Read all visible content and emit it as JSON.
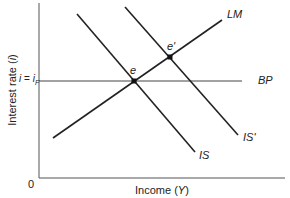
{
  "diagram": {
    "y_axis": {
      "label_text": "Interest rate (",
      "label_var": "i",
      "label_close": ")"
    },
    "x_axis": {
      "label_text": "Income (",
      "label_var": "Y",
      "label_close": ")"
    },
    "origin_label": "0",
    "bp_level_label": {
      "lhs": "i",
      "eq": " = ",
      "rhs": "i",
      "sub": "F"
    },
    "curves": [
      {
        "id": "LM",
        "label": "LM",
        "x1": 53,
        "y1": 138,
        "x2": 222,
        "y2": 20
      },
      {
        "id": "IS",
        "label": "IS",
        "x1": 77,
        "y1": 14,
        "x2": 195,
        "y2": 152
      },
      {
        "id": "IS_prime",
        "label": "IS'",
        "x1": 125,
        "y1": 7,
        "x2": 238,
        "y2": 135
      },
      {
        "id": "BP",
        "label": "BP",
        "x1": 39,
        "y1": 81,
        "x2": 242,
        "y2": 81
      }
    ],
    "points": [
      {
        "id": "e",
        "label": "e",
        "x": 134,
        "y": 81
      },
      {
        "id": "e_prime",
        "label": "e'",
        "x": 170,
        "y": 57
      }
    ],
    "colors": {
      "line": "#222222",
      "axis": "#555555",
      "text": "#222222"
    }
  }
}
